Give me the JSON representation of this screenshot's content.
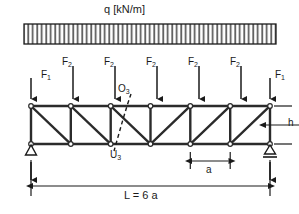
{
  "figure": {
    "stroke_color": "#1a1a1a",
    "hatch_color": "#555555"
  },
  "distributed_load": {
    "label": "q [kN/m]",
    "x_start": 24,
    "x_end": 276,
    "y_top": 24,
    "y_bottom": 44,
    "hatch_count": 56
  },
  "point_loads": {
    "end_label": "F",
    "end_sub": "1",
    "mid_label": "F",
    "mid_sub": "2",
    "labels": [
      {
        "name": "F",
        "sub": "1",
        "x": 40,
        "y": 76
      },
      {
        "name": "F",
        "sub": "2",
        "x": 67,
        "y": 58
      },
      {
        "name": "F",
        "sub": "2",
        "x": 110,
        "y": 58
      },
      {
        "name": "F",
        "sub": "2",
        "x": 152,
        "y": 58
      },
      {
        "name": "F",
        "sub": "2",
        "x": 194,
        "y": 58
      },
      {
        "name": "F",
        "sub": "2",
        "x": 236,
        "y": 58
      },
      {
        "name": "F",
        "sub": "1",
        "x": 277,
        "y": 76
      }
    ],
    "arrows": [
      {
        "x": 31,
        "y_top": 78,
        "y_bottom": 105
      },
      {
        "x": 73,
        "y_top": 66,
        "y_bottom": 105
      },
      {
        "x": 115,
        "y_top": 66,
        "y_bottom": 105
      },
      {
        "x": 157,
        "y_top": 66,
        "y_bottom": 105
      },
      {
        "x": 199,
        "y_top": 66,
        "y_bottom": 105
      },
      {
        "x": 241,
        "y_top": 66,
        "y_bottom": 105
      },
      {
        "x": 270,
        "y_top": 78,
        "y_bottom": 105
      }
    ]
  },
  "truss": {
    "x_left": 31,
    "x_right": 270,
    "y_top": 106,
    "y_bottom": 144,
    "panels": 6,
    "panel_width": 39.83,
    "top_nodes": [
      31,
      70.8,
      110.7,
      150.5,
      190.3,
      230.2,
      270
    ],
    "bottom_nodes": [
      31,
      70.8,
      110.7,
      150.5,
      190.3,
      230.2,
      270
    ],
    "diagonals": [
      {
        "panel": 1,
        "direction": "top-left-to-bottom-right"
      },
      {
        "panel": 2,
        "direction": "top-left-to-bottom-right"
      },
      {
        "panel": 3,
        "direction": "top-left-to-bottom-right"
      },
      {
        "panel": 4,
        "direction": "bottom-left-to-top-right"
      },
      {
        "panel": 5,
        "direction": "bottom-left-to-top-right"
      },
      {
        "panel": 6,
        "direction": "bottom-left-to-top-right"
      }
    ]
  },
  "member_labels": {
    "upper_chord": {
      "text": "O",
      "sub": "3",
      "x": 119,
      "y": 86
    },
    "lower_chord": {
      "text": "U",
      "sub": "3",
      "x": 113,
      "y": 152
    }
  },
  "section_cut": {
    "name": "ritter-section-line",
    "x_top": 130,
    "y_top": 95,
    "x_bottom": 114,
    "y_bottom": 150,
    "style": "dashed"
  },
  "supports": {
    "left": {
      "type": "pin",
      "x": 31,
      "y": 144
    },
    "right": {
      "type": "roller",
      "x": 270,
      "y": 144
    }
  },
  "reactions": [
    {
      "x": 31,
      "y_bottom": 180,
      "y_top": 155
    },
    {
      "x": 270,
      "y_bottom": 180,
      "y_top": 155
    }
  ],
  "dimensions": {
    "panel": {
      "label": "a",
      "x_start": 190.3,
      "x_end": 230.2,
      "y": 161,
      "label_x": 206,
      "label_y": 168
    },
    "span": {
      "label": "L = 6 a",
      "x_start": 31,
      "x_end": 270,
      "y": 186,
      "label_x": 124,
      "label_y": 192
    },
    "height": {
      "label": "h",
      "x": 283,
      "y_top": 106,
      "y_bottom": 144,
      "label_x": 288,
      "label_y": 120
    }
  }
}
